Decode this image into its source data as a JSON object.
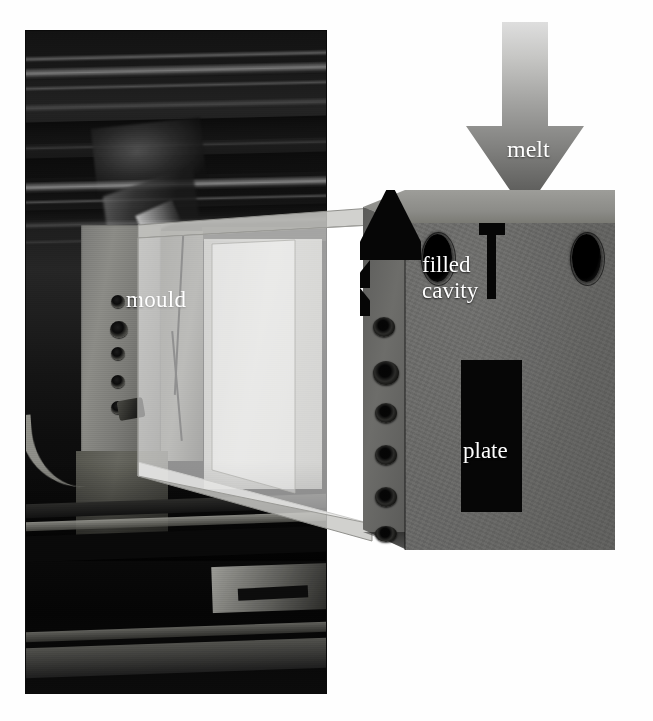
{
  "figure": {
    "background_color": "#ffffff"
  },
  "photograph": {
    "name": "injection-moulding-machine-photo",
    "description": "Photograph of the interior of an injection moulding machine showing the mould mounted on the platen",
    "label": "mould",
    "border_color": "#0a0a0a"
  },
  "callout": {
    "name": "magnification-callout",
    "description": "Translucent light-grey band linking the mould in the photograph to the 3D schematic",
    "fill_color": "#d8d8d4",
    "stroke_color": "#9a9a96"
  },
  "melt_arrow": {
    "label": "melt",
    "direction": "down",
    "gradient_top_color": "#d9d9d9",
    "gradient_bottom_color": "#5a5a58",
    "text_color": "#ffffff"
  },
  "schematic": {
    "name": "mould-block-3d",
    "front_face_color": "#676765",
    "top_face_color": "#8f8f8b",
    "side_face_color": "#63635f",
    "cavity_color": "#060606",
    "labels": {
      "filled_cavity_line1": "filled",
      "filled_cavity_line2": "cavity",
      "plate": "plate"
    },
    "features": {
      "sprue_bushing": "sprue-bushing",
      "sprue": "sprue-channel",
      "gate": "fan-gate",
      "plate_cavity": "plate-cavity",
      "corner_bores": 2,
      "side_fittings": 6
    }
  }
}
